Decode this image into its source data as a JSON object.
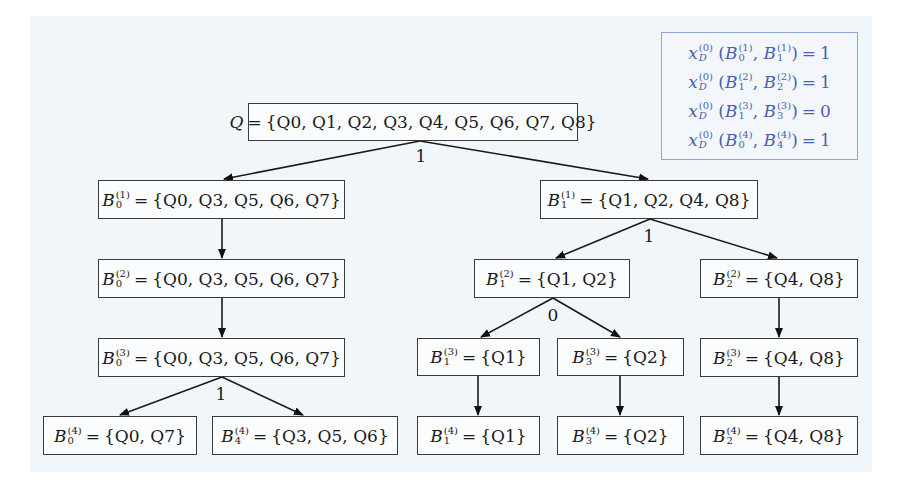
{
  "diagram": {
    "root": {
      "lhs": "Q",
      "set": "{Q0, Q1, Q2, Q3, Q4, Q5, Q6, Q7, Q8}"
    },
    "nodes": [
      {
        "id": "B0_1",
        "base": "B",
        "sub": "0",
        "sup": "(1)",
        "set": "{Q0, Q3, Q5, Q6, Q7}"
      },
      {
        "id": "B1_1",
        "base": "B",
        "sub": "1",
        "sup": "(1)",
        "set": "{Q1, Q2, Q4, Q8}"
      },
      {
        "id": "B0_2",
        "base": "B",
        "sub": "0",
        "sup": "(2)",
        "set": "{Q0, Q3, Q5, Q6, Q7}"
      },
      {
        "id": "B1_2",
        "base": "B",
        "sub": "1",
        "sup": "(2)",
        "set": "{Q1, Q2}"
      },
      {
        "id": "B2_2",
        "base": "B",
        "sub": "2",
        "sup": "(2)",
        "set": "{Q4, Q8}"
      },
      {
        "id": "B0_3",
        "base": "B",
        "sub": "0",
        "sup": "(3)",
        "set": "{Q0, Q3, Q5, Q6, Q7}"
      },
      {
        "id": "B1_3",
        "base": "B",
        "sub": "1",
        "sup": "(3)",
        "set": "{Q1}"
      },
      {
        "id": "B3_3",
        "base": "B",
        "sub": "3",
        "sup": "(3)",
        "set": "{Q2}"
      },
      {
        "id": "B2_3",
        "base": "B",
        "sub": "2",
        "sup": "(3)",
        "set": "{Q4, Q8}"
      },
      {
        "id": "B0_4",
        "base": "B",
        "sub": "0",
        "sup": "(4)",
        "set": "{Q0, Q7}"
      },
      {
        "id": "B4_4",
        "base": "B",
        "sub": "4",
        "sup": "(4)",
        "set": "{Q3, Q5, Q6}"
      },
      {
        "id": "B1_4",
        "base": "B",
        "sub": "1",
        "sup": "(4)",
        "set": "{Q1}"
      },
      {
        "id": "B3_4",
        "base": "B",
        "sub": "3",
        "sup": "(4)",
        "set": "{Q2}"
      },
      {
        "id": "B2_4",
        "base": "B",
        "sub": "2",
        "sup": "(4)",
        "set": "{Q4, Q8}"
      }
    ],
    "edge_labels": {
      "root_split": "1",
      "b1_1_split": "1",
      "b1_2_split": "0",
      "b0_3_split": "1"
    },
    "equals": "="
  },
  "legend": {
    "rows": [
      {
        "fn": "x",
        "fn_sup": "(0)",
        "fn_sub": "D",
        "a_sub": "0",
        "a_sup": "(1)",
        "b_sub": "1",
        "b_sup": "(1)",
        "value": "1"
      },
      {
        "fn": "x",
        "fn_sup": "(0)",
        "fn_sub": "D",
        "a_sub": "1",
        "a_sup": "(2)",
        "b_sub": "2",
        "b_sup": "(2)",
        "value": "1"
      },
      {
        "fn": "x",
        "fn_sup": "(0)",
        "fn_sub": "D",
        "a_sub": "1",
        "a_sup": "(3)",
        "b_sub": "3",
        "b_sup": "(3)",
        "value": "0"
      },
      {
        "fn": "x",
        "fn_sup": "(0)",
        "fn_sub": "D",
        "a_sub": "0",
        "a_sup": "(4)",
        "b_sub": "4",
        "b_sup": "(4)",
        "value": "1"
      }
    ],
    "colors": {
      "text": "#4a5fb0",
      "border": "#8aa6d6"
    }
  }
}
